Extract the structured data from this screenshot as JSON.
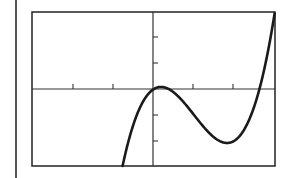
{
  "chart_data": {
    "type": "line",
    "title": "",
    "xlabel": "",
    "ylabel": "",
    "function": "f(x) ≈ 0.96·(x³ − 3.075x² + 1.11x) − 0.023",
    "coefficients": {
      "a3": 0.96,
      "a2": -2.952,
      "a1": 1.066,
      "a0": -0.023
    },
    "xlim": [
      -3.0,
      3.05
    ],
    "ylim": [
      -2.96,
      2.96
    ],
    "x_ticks": [
      -2,
      -1,
      1,
      2
    ],
    "y_ticks": [
      -2,
      -1,
      1,
      2
    ],
    "tick_labels_shown": false,
    "grid": false,
    "legend": null,
    "key_points": [
      {
        "label": "enters-bottom",
        "x": -0.78,
        "y": -2.96
      },
      {
        "label": "local-max",
        "x": 0.2,
        "y": 0.08
      },
      {
        "label": "local-min",
        "x": 1.85,
        "y": -2.08
      },
      {
        "label": "x-intercept",
        "x": 2.65,
        "y": 0
      },
      {
        "label": "exits-top-right",
        "x": 3.05,
        "y": 2.96
      }
    ],
    "series": [
      {
        "name": "cubic",
        "x": [
          -0.78,
          -0.5,
          -0.25,
          0.0,
          0.2,
          0.5,
          0.75,
          1.0,
          1.25,
          1.5,
          1.85,
          2.0,
          2.25,
          2.5,
          2.65,
          2.75,
          3.0,
          3.05
        ],
        "y": [
          -2.96,
          -1.47,
          -0.49,
          -0.02,
          0.08,
          -0.05,
          -0.43,
          -0.95,
          -1.46,
          -1.88,
          -2.08,
          -2.05,
          -1.83,
          -1.23,
          -0.7,
          -0.29,
          2.45,
          2.96
        ]
      }
    ]
  },
  "colors": {
    "curve": "#1a1a1a",
    "axes": "#333333",
    "frame": "#222222",
    "background": "#ffffff"
  }
}
